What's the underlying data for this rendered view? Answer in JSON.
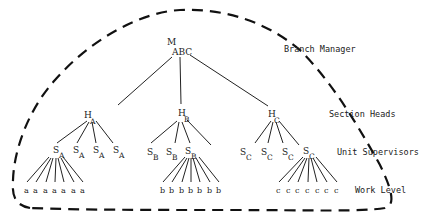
{
  "diagram": {
    "type": "organization-hierarchy",
    "levels": [
      {
        "id": "manager",
        "label": "Branch Manager"
      },
      {
        "id": "section",
        "label": "Section Heads"
      },
      {
        "id": "unit",
        "label": "Unit Supervisors"
      },
      {
        "id": "work",
        "label": "Work Level"
      }
    ],
    "root": {
      "main": "M",
      "sub": "ABC"
    },
    "sections": [
      {
        "head": {
          "main": "H",
          "sub": "A"
        },
        "supervisors": [
          {
            "main": "S",
            "sub": "A"
          },
          {
            "main": "S",
            "sub": "A"
          },
          {
            "main": "S",
            "sub": "A"
          },
          {
            "main": "S",
            "sub": "A"
          }
        ],
        "expanded_supervisor_index": 0,
        "workers": [
          "a",
          "a",
          "a",
          "a",
          "a",
          "a",
          "a"
        ]
      },
      {
        "head": {
          "main": "H",
          "sub": "B"
        },
        "supervisors": [
          {
            "main": "S",
            "sub": "B"
          },
          {
            "main": "S",
            "sub": "B"
          },
          {
            "main": "S",
            "sub": "B"
          },
          {
            "main": "",
            "sub": ""
          }
        ],
        "expanded_supervisor_index": 2,
        "workers": [
          "b",
          "b",
          "b",
          "b",
          "b",
          "b",
          "b"
        ]
      },
      {
        "head": {
          "main": "H",
          "sub": "C"
        },
        "supervisors": [
          {
            "main": "S",
            "sub": "C"
          },
          {
            "main": "S",
            "sub": "C"
          },
          {
            "main": "S",
            "sub": "C"
          },
          {
            "main": "S",
            "sub": "C"
          }
        ],
        "expanded_supervisor_index": 3,
        "workers": [
          "c",
          "c",
          "c",
          "c",
          "c",
          "c",
          "c"
        ]
      }
    ],
    "boundary": "dashed"
  }
}
